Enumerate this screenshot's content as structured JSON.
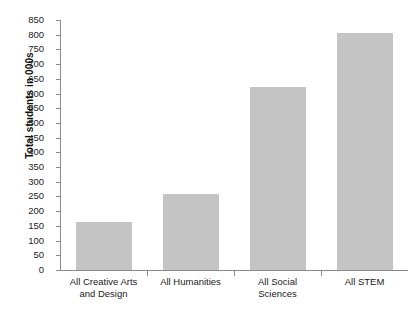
{
  "chart_data": {
    "type": "bar",
    "title": "",
    "xlabel": "",
    "ylabel": "Total students in 000s",
    "categories": [
      "All Creative Arts and Design",
      "All Humanities",
      "All Social Sciences",
      "All STEM"
    ],
    "category_lines": [
      [
        "All Creative Arts",
        "and Design"
      ],
      [
        "All Humanities",
        ""
      ],
      [
        "All Social",
        "Sciences"
      ],
      [
        "All STEM",
        ""
      ]
    ],
    "values": [
      162,
      260,
      622,
      806
    ],
    "ylim": [
      0,
      850
    ],
    "ytick_step": 50,
    "yticks": [
      0,
      50,
      100,
      150,
      200,
      250,
      300,
      350,
      400,
      450,
      500,
      550,
      600,
      650,
      700,
      750,
      800,
      850
    ],
    "grid": false,
    "legend": "none",
    "bar_color": "#c4c4c4",
    "axis_color": "#8a8a8a"
  },
  "top_crop_text": "",
  "axis": {
    "y_title": "Total students in 000s"
  }
}
